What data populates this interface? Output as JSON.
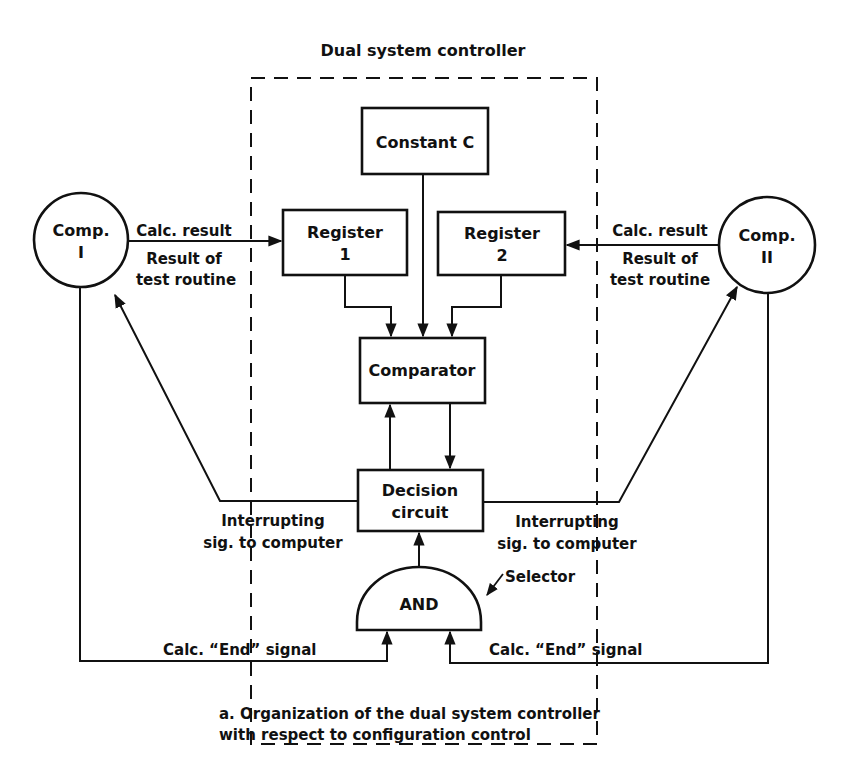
{
  "diagram": {
    "title": "Dual system controller",
    "caption": {
      "line1": "a. Organization of the dual system controller",
      "line2": "with respect to configuration control"
    },
    "nodes": {
      "comp1": {
        "line1": "Comp.",
        "line2": "I"
      },
      "comp2": {
        "line1": "Comp.",
        "line2": "II"
      },
      "constant": {
        "label": "Constant C"
      },
      "register1": {
        "line1": "Register",
        "line2": "1"
      },
      "register2": {
        "line1": "Register",
        "line2": "2"
      },
      "comparator": {
        "label": "Comparator"
      },
      "decision": {
        "line1": "Decision",
        "line2": "circuit"
      },
      "and_gate": {
        "label": "AND"
      }
    },
    "labels": {
      "left_calc_result": "Calc. result",
      "left_result_of": "Result of",
      "left_test_routine": "test routine",
      "right_calc_result": "Calc. result",
      "right_result_of": "Result of",
      "right_test_routine": "test routine",
      "left_interrupt_1": "Interrupting",
      "left_interrupt_2": "sig. to computer",
      "right_interrupt_1": "Interrupting",
      "right_interrupt_2": "sig. to computer",
      "selector": "Selector",
      "left_end_signal": "Calc. “End” signal",
      "right_end_signal": "Calc. “End” signal"
    },
    "colors": {
      "ink": "#111111",
      "background": "#ffffff"
    }
  }
}
